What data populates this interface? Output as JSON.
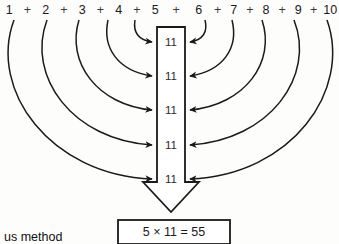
{
  "diagram": {
    "title_caption": "us method",
    "sum_row": {
      "terms": [
        "1",
        "2",
        "3",
        "4",
        "5",
        "6",
        "7",
        "8",
        "9",
        "10"
      ],
      "operator": "+"
    },
    "pair_labels": [
      "11",
      "11",
      "11",
      "11",
      "11"
    ],
    "result": {
      "expression": "5 × 11 = 55",
      "factor_count": "5",
      "pair_value": "11",
      "total": "55"
    },
    "arc_count_left": 5,
    "arc_count_right": 5,
    "colors": {
      "stroke": "#1a1a1a",
      "background": "#fdfdfc",
      "text": "#1a1a1a"
    }
  }
}
